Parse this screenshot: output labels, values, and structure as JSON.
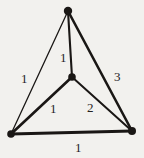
{
  "figure": {
    "type": "weighted-graph-diagram",
    "background_color": "#f2f1ee",
    "ink_color": "#1a1715",
    "width": 144,
    "height": 158
  },
  "chart_data": {
    "type": "diagram",
    "title": "",
    "subtitle": "",
    "xlabel": "",
    "ylabel": "",
    "grid": false,
    "legend": null,
    "nodes": [
      {
        "id": "top",
        "label": "",
        "x": 68,
        "y": 11,
        "radius": 4.2
      },
      {
        "id": "center",
        "label": "",
        "x": 72,
        "y": 77,
        "radius": 3.8
      },
      {
        "id": "bottom-left",
        "label": "",
        "x": 11,
        "y": 134,
        "radius": 3.8
      },
      {
        "id": "bottom-right",
        "label": "",
        "x": 132,
        "y": 131,
        "radius": 4.0
      }
    ],
    "edges": [
      {
        "id": "top-center",
        "from": "top",
        "to": "center",
        "weight": "1",
        "thickness": 2.1,
        "label_x": 60,
        "label_y": 51
      },
      {
        "id": "top-bottom-left",
        "from": "top",
        "to": "bottom-left",
        "weight": "1",
        "thickness": 1.3,
        "label_x": 21,
        "label_y": 72
      },
      {
        "id": "top-bottom-right",
        "from": "top",
        "to": "bottom-right",
        "weight": "3",
        "thickness": 2.6,
        "label_x": 114,
        "label_y": 70
      },
      {
        "id": "center-bottom-left",
        "from": "center",
        "to": "bottom-left",
        "weight": "1",
        "thickness": 2.6,
        "label_x": 50,
        "label_y": 102
      },
      {
        "id": "center-bottom-right",
        "from": "center",
        "to": "bottom-right",
        "weight": "2",
        "thickness": 2.0,
        "label_x": 87,
        "label_y": 101
      },
      {
        "id": "bottom-left-right",
        "from": "bottom-left",
        "to": "bottom-right",
        "weight": "1",
        "thickness": 3.0,
        "label_x": 75,
        "label_y": 141
      }
    ]
  }
}
